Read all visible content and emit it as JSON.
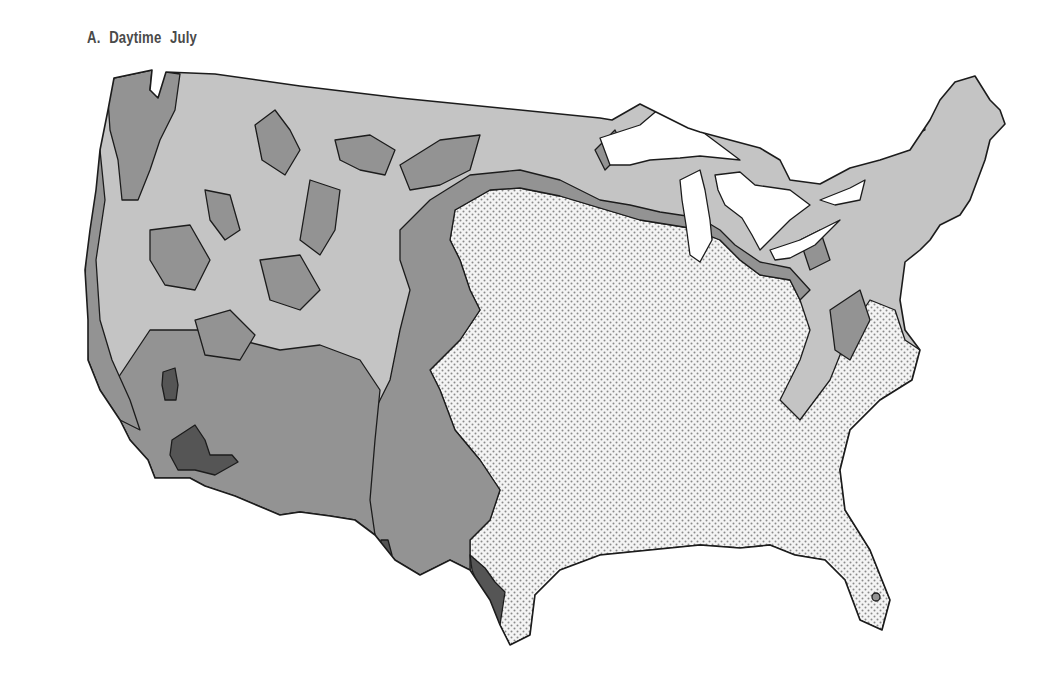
{
  "map": {
    "title": "A. Daytime  July",
    "subject": "Contiguous United States",
    "zones": [
      {
        "name": "white",
        "color": "#ffffff",
        "description": "Great Lakes / water"
      },
      {
        "name": "light-gray",
        "color": "#c4c4c4",
        "description": "Northern and mountain areas"
      },
      {
        "name": "medium-gray",
        "color": "#939393",
        "description": "Transitional bands"
      },
      {
        "name": "dark-gray",
        "color": "#555555",
        "description": "Desert southwest / Rio Grande pockets"
      },
      {
        "name": "dotted",
        "color": "#f2f2f2",
        "pattern": "dots",
        "description": "South and Southeast"
      }
    ]
  }
}
